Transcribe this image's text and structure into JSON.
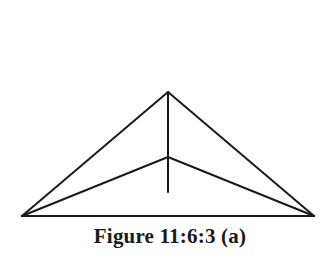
{
  "figure": {
    "caption": "Figure 11:6:3 (a)",
    "stroke_color": "#1a1a1a",
    "points": {
      "apex": [
        168,
        92
      ],
      "inner": [
        168,
        157
      ],
      "stem_end": [
        168,
        192
      ],
      "base_left": [
        22,
        216
      ],
      "base_right": [
        314,
        216
      ]
    },
    "segments": [
      [
        "base_left",
        "base_right"
      ],
      [
        "base_left",
        "apex"
      ],
      [
        "apex",
        "base_right"
      ],
      [
        "base_left",
        "inner"
      ],
      [
        "inner",
        "base_right"
      ],
      [
        "apex",
        "stem_end"
      ]
    ]
  }
}
